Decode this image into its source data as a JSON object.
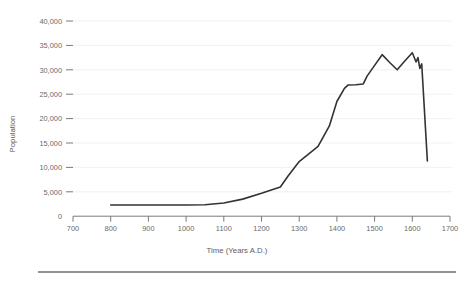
{
  "chart_data": {
    "type": "line",
    "title": "",
    "xlabel": "Time (Years A.D.)",
    "ylabel": "Population",
    "xlim": [
      700,
      1700
    ],
    "ylim": [
      0,
      40000
    ],
    "grid": true,
    "legend": false,
    "xticks": [
      700,
      800,
      900,
      1000,
      1100,
      1200,
      1300,
      1400,
      1500,
      1600,
      1700
    ],
    "xtick_labels": [
      "700",
      "800",
      "900",
      "1000",
      "1100",
      "1200",
      "1300",
      "1400",
      "1500",
      "1600",
      "1700"
    ],
    "yticks": [
      0,
      5000,
      10000,
      15000,
      20000,
      25000,
      30000,
      35000,
      40000
    ],
    "ytick_labels": [
      "0",
      "5,000",
      "10,000",
      "15,000",
      "20,000",
      "25,000",
      "30,000",
      "35,000",
      "40,000"
    ],
    "series": [
      {
        "name": "Population",
        "color": "#333333",
        "x": [
          800,
          900,
          1000,
          1050,
          1100,
          1150,
          1200,
          1250,
          1270,
          1300,
          1350,
          1380,
          1400,
          1420,
          1430,
          1450,
          1470,
          1480,
          1500,
          1520,
          1540,
          1560,
          1580,
          1600,
          1610,
          1615,
          1620,
          1625,
          1640
        ],
        "y": [
          2300,
          2300,
          2300,
          2350,
          2700,
          3500,
          4700,
          6000,
          8200,
          11200,
          14300,
          18500,
          23500,
          26200,
          26900,
          26950,
          27100,
          28700,
          30900,
          33100,
          31500,
          30000,
          31800,
          33500,
          31600,
          32500,
          30300,
          31200,
          11300
        ]
      }
    ]
  },
  "axis": {
    "x_title": "Time (Years A.D.)",
    "y_title": "Population"
  }
}
